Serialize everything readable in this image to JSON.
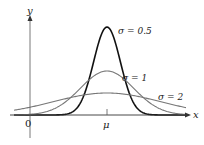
{
  "chart_data": {
    "type": "line",
    "title": "",
    "xlabel": "x",
    "ylabel": "y",
    "x_ticks": [
      {
        "label": "0",
        "value": 0
      },
      {
        "label": "μ",
        "value": "mu"
      }
    ],
    "grid": false,
    "legend": "inline labels",
    "series": [
      {
        "name": "σ = 0.5",
        "sigma": 0.5,
        "color": "#111111",
        "stroke_width": 1.6,
        "peak_relative": 4
      },
      {
        "name": "σ = 1",
        "sigma": 1,
        "color": "#777777",
        "stroke_width": 1.1,
        "peak_relative": 2
      },
      {
        "name": "σ = 2",
        "sigma": 2,
        "color": "#777777",
        "stroke_width": 1.1,
        "peak_relative": 1
      }
    ]
  },
  "labels": {
    "y_axis": "y",
    "x_axis": "x",
    "origin": "0",
    "mu": "μ",
    "s05": "σ = 0.5",
    "s1": "σ = 1",
    "s2": "σ = 2"
  },
  "geometry": {
    "origin_x": 30,
    "axis_y": 115,
    "mu_x": 107,
    "px_per_unit": 26.7,
    "peak_px_sigma05": 88
  }
}
